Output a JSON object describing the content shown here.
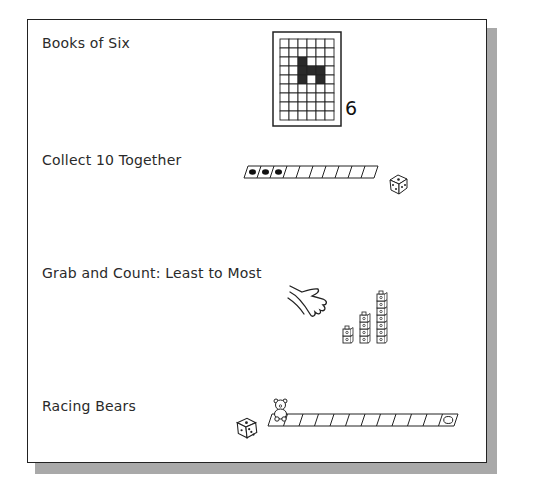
{
  "activities": [
    {
      "title": "Books of Six",
      "illustration": {
        "type": "grid-card",
        "columns": 6,
        "rows": 9,
        "shaded_cells": [
          [
            2,
            2
          ],
          [
            3,
            2
          ],
          [
            4,
            2
          ],
          [
            3,
            3
          ],
          [
            3,
            4
          ],
          [
            4,
            4
          ]
        ],
        "number": "6"
      }
    },
    {
      "title": "Collect 10 Together",
      "illustration": {
        "type": "counting-strip",
        "cells": 10,
        "filled_cells": 3,
        "icon": "die-icon"
      }
    },
    {
      "title": "Grab and Count: Least to Most",
      "illustration": {
        "type": "hand-and-cube-towers",
        "icon": "hand-icon",
        "tower_heights": [
          2,
          4,
          7
        ]
      }
    },
    {
      "title": "Racing Bears",
      "illustration": {
        "type": "race-track",
        "cells": 12,
        "icons": [
          "die-icon",
          "bear-counter-icon",
          "finish-circle-icon"
        ]
      }
    }
  ],
  "colors": {
    "ink": "#222222",
    "shadow": "#a9a9a9",
    "background": "#ffffff"
  }
}
